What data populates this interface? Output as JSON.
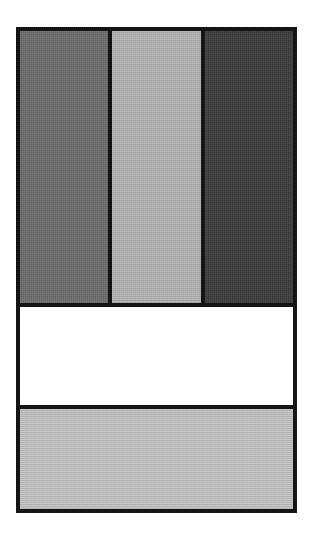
{
  "figure": {
    "frame": {
      "border_color": "#151515"
    },
    "top_row": {
      "bars": [
        {
          "name": "left-bar",
          "shade": "medium-gray",
          "color": "#6e6e6e"
        },
        {
          "name": "middle-bar",
          "shade": "light-gray",
          "color": "#b4b4b4"
        },
        {
          "name": "right-bar",
          "shade": "dark-gray",
          "color": "#3c3c3c"
        }
      ]
    },
    "bands": [
      {
        "name": "white-band",
        "shade": "white",
        "color": "#ffffff"
      },
      {
        "name": "light-gray-band",
        "shade": "light-gray",
        "color": "#c4c4c4"
      }
    ]
  }
}
